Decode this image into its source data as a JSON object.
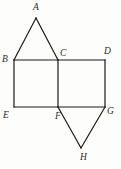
{
  "figure": {
    "name": "geometry-figure-two-squares-with-triangles",
    "background_color": "#fdfdfc",
    "stroke_color": "#1a1a1a",
    "label_color": "#2b2b2b",
    "stroke_width": 1.2,
    "canvas": {
      "width": 121,
      "height": 169
    }
  },
  "vertices": [
    {
      "id": "A",
      "label": "A",
      "x": 36,
      "y": 18,
      "label_x": 33,
      "label_y": 2
    },
    {
      "id": "B",
      "label": "B",
      "x": 14,
      "y": 60,
      "label_x": 2,
      "label_y": 54
    },
    {
      "id": "C",
      "label": "C",
      "x": 58,
      "y": 60,
      "label_x": 60,
      "label_y": 48
    },
    {
      "id": "D",
      "label": "D",
      "x": 105,
      "y": 60,
      "label_x": 104,
      "label_y": 46
    },
    {
      "id": "E",
      "label": "E",
      "x": 14,
      "y": 107,
      "label_x": 3,
      "label_y": 110
    },
    {
      "id": "F",
      "label": "F",
      "x": 58,
      "y": 107,
      "label_x": 55,
      "label_y": 111
    },
    {
      "id": "G",
      "label": "G",
      "x": 105,
      "y": 107,
      "label_x": 107,
      "label_y": 106
    },
    {
      "id": "H",
      "label": "H",
      "x": 81,
      "y": 148,
      "label_x": 80,
      "label_y": 152
    }
  ],
  "edges": [
    {
      "name": "edge-A-B",
      "from": "A",
      "to": "B"
    },
    {
      "name": "edge-A-C",
      "from": "A",
      "to": "C"
    },
    {
      "name": "edge-B-C",
      "from": "B",
      "to": "C"
    },
    {
      "name": "edge-C-D",
      "from": "C",
      "to": "D"
    },
    {
      "name": "edge-B-E",
      "from": "B",
      "to": "E"
    },
    {
      "name": "edge-C-F",
      "from": "C",
      "to": "F"
    },
    {
      "name": "edge-D-G",
      "from": "D",
      "to": "G"
    },
    {
      "name": "edge-E-F",
      "from": "E",
      "to": "F"
    },
    {
      "name": "edge-F-G",
      "from": "F",
      "to": "G"
    },
    {
      "name": "edge-F-H",
      "from": "F",
      "to": "H"
    },
    {
      "name": "edge-G-H",
      "from": "G",
      "to": "H"
    }
  ],
  "shapes": [
    {
      "name": "triangle-ABC",
      "vertices": "A,B,C"
    },
    {
      "name": "square-BCFE",
      "vertices": "B,C,F,E"
    },
    {
      "name": "square-CDGF",
      "vertices": "C,D,G,F"
    },
    {
      "name": "triangle-FGH",
      "vertices": "F,G,H"
    }
  ]
}
